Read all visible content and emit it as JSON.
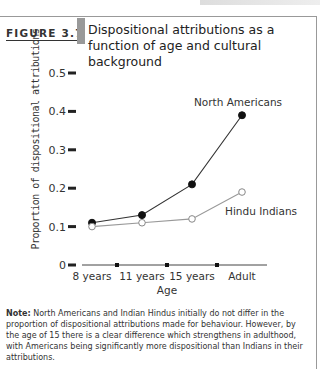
{
  "figure": {
    "label": "FIGURE 3.7",
    "title": "Dispositional attributions as a function of age and cultural background"
  },
  "note": {
    "prefix": "Note:",
    "text": " North Americans and Indian Hindus initially do not differ in the proportion of dispositional attributions made for behaviour. However, by the age of 15 there is a clear difference which strengthens in adulthood, with Americans being significantly more dispositional than Indians in their attributions."
  },
  "chart_data": {
    "type": "line",
    "title": "Dispositional attributions as a function of age and cultural background",
    "xlabel": "Age",
    "ylabel": "Proportion of dispositional attributions",
    "categories": [
      "8 years",
      "11 years",
      "15 years",
      "Adult"
    ],
    "yticks": [
      "0",
      "0.1",
      "0.2",
      "0.3",
      "0.4",
      "0.5"
    ],
    "ylim": [
      0,
      0.5
    ],
    "grid": false,
    "series": [
      {
        "name": "North Americans",
        "marker": "filled-circle",
        "values": [
          0.11,
          0.13,
          0.21,
          0.39
        ]
      },
      {
        "name": "Hindu Indians",
        "marker": "open-circle",
        "values": [
          0.1,
          0.11,
          0.12,
          0.19
        ]
      }
    ],
    "legend": "inline labels near line ends"
  }
}
